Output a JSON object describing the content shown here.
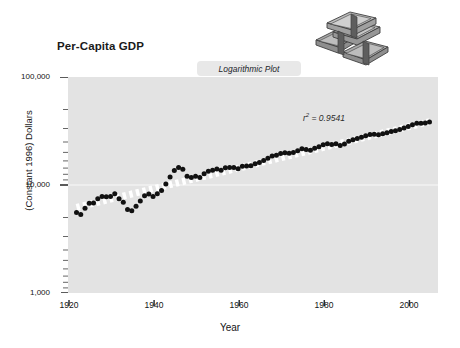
{
  "figure": {
    "title": "Per-Capita GDP",
    "badge_label": "Logarithmic Plot",
    "money_icon": "money-stack-icon",
    "background_color": "#ffffff",
    "plot_background_color": "#e3e3e3",
    "marker_color": "#111111",
    "trendline_color": "#ffffff"
  },
  "annotation": {
    "r_symbol": "r",
    "r_exponent": "2",
    "r_equals": " = 0.9541",
    "r_squared_value": 0.9541,
    "full_text": "r 2 = 0.9541"
  },
  "chart_data": {
    "type": "scatter",
    "title": "Per-Capita GDP",
    "subtitle": "Logarithmic Plot",
    "xlabel": "Year",
    "ylabel": "(Constant 1996) Dollars",
    "yscale": "log",
    "xscale": "linear",
    "xlim": [
      1918,
      2005
    ],
    "ylim": [
      1000,
      100000
    ],
    "grid": true,
    "legend": "none",
    "y_tick_labels": [
      "100,000",
      "10,000",
      "1,000"
    ],
    "y_tick_values": [
      100000,
      10000,
      1000
    ],
    "x_tick_labels": [
      "1920",
      "1940",
      "1960",
      "1980",
      "2000"
    ],
    "x_tick_values": [
      1920,
      1940,
      1960,
      1980,
      2000
    ],
    "annotations": [
      {
        "text": "r 2 = 0.9541",
        "x": 1985,
        "y": 38000
      }
    ],
    "series": [
      {
        "name": "Per-Capita GDP",
        "marker": "filled-circle",
        "x": [
          1920,
          1921,
          1922,
          1923,
          1924,
          1925,
          1926,
          1927,
          1928,
          1929,
          1930,
          1931,
          1932,
          1933,
          1934,
          1935,
          1936,
          1937,
          1938,
          1939,
          1940,
          1941,
          1942,
          1943,
          1944,
          1945,
          1946,
          1947,
          1948,
          1949,
          1950,
          1951,
          1952,
          1953,
          1954,
          1955,
          1956,
          1957,
          1958,
          1959,
          1960,
          1961,
          1962,
          1963,
          1964,
          1965,
          1966,
          1967,
          1968,
          1969,
          1970,
          1971,
          1972,
          1973,
          1974,
          1975,
          1976,
          1977,
          1978,
          1979,
          1980,
          1981,
          1982,
          1983,
          1984,
          1985,
          1986,
          1987,
          1988,
          1989,
          1990,
          1991,
          1992,
          1993,
          1994,
          1995,
          1996,
          1997,
          1998,
          1999,
          2000,
          2001,
          2002,
          2003
        ],
        "y": [
          5550,
          5330,
          6080,
          6780,
          6800,
          7460,
          7840,
          7790,
          7820,
          8300,
          7470,
          6930,
          5930,
          5790,
          6340,
          7120,
          7970,
          8250,
          7820,
          8320,
          8910,
          10230,
          11830,
          13600,
          14500,
          14000,
          12070,
          11760,
          12030,
          11760,
          12680,
          13410,
          13660,
          14030,
          13690,
          14450,
          14500,
          14510,
          14150,
          14890,
          15000,
          15040,
          15720,
          16160,
          16880,
          17710,
          18600,
          18850,
          19550,
          19930,
          19650,
          19980,
          20780,
          21700,
          21290,
          21010,
          21880,
          22620,
          23580,
          24040,
          23730,
          24040,
          23200,
          23990,
          25480,
          26260,
          26930,
          27630,
          28540,
          29330,
          29570,
          29220,
          29880,
          30400,
          31310,
          31850,
          32690,
          33770,
          34840,
          36100,
          37280,
          37260,
          37600,
          38300
        ],
        "count": 84
      },
      {
        "name": "Log-Linear Trend",
        "type": "trendline",
        "style": "dashed",
        "color": "#ffffff",
        "x": [
          1920,
          2003
        ],
        "y": [
          6200,
          38600
        ]
      }
    ]
  },
  "axes": {
    "x_title": "Year",
    "y_title": "(Constant 1996) Dollars"
  }
}
